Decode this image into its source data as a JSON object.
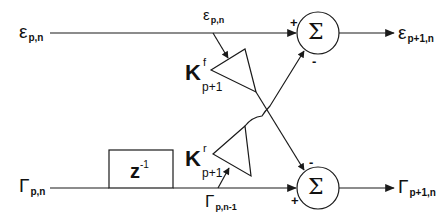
{
  "diagram": {
    "type": "lattice-filter-stage",
    "inputs": {
      "forward": {
        "symbol": "ε",
        "subscript": "p,n"
      },
      "backward": {
        "symbol": "Γ",
        "subscript": "p,n"
      }
    },
    "outputs": {
      "forward": {
        "symbol": "ε",
        "subscript": "p+1,n"
      },
      "backward": {
        "symbol": "Γ",
        "subscript": "p+1,n"
      }
    },
    "taps": {
      "forward_tap": {
        "symbol": "ε",
        "subscript": "p,n"
      },
      "delayed_tap": {
        "symbol": "Γ",
        "subscript": "p,n-1"
      }
    },
    "gains": {
      "forward": {
        "symbol": "K",
        "superscript": "f",
        "subscript": "p+1"
      },
      "backward": {
        "symbol": "K",
        "superscript": "r",
        "subscript": "p+1"
      }
    },
    "delay": {
      "symbol": "z",
      "superscript": "-1"
    },
    "summers": {
      "top": {
        "symbol": "Σ",
        "plus_sign": "+",
        "minus_sign": "-"
      },
      "bottom": {
        "symbol": "Σ",
        "plus_sign": "+",
        "minus_sign": "-"
      }
    },
    "colors": {
      "stroke": "#1a1a1a",
      "background": "#ffffff"
    }
  }
}
